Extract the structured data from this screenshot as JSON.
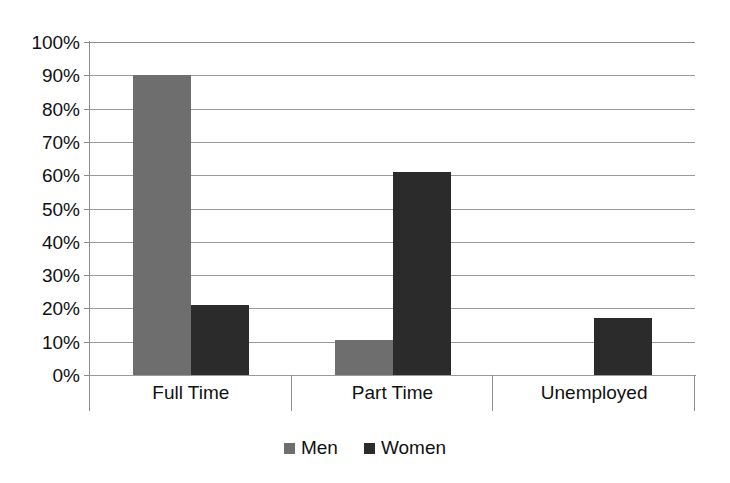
{
  "chart_data": {
    "type": "bar",
    "title": "",
    "subtitle": "",
    "xlabel": "",
    "ylabel": "",
    "categories": [
      "Full Time",
      "Part Time",
      "Unemployed"
    ],
    "series": [
      {
        "name": "Men",
        "color": "#6e6e6e",
        "values": [
          90,
          10.5,
          0
        ]
      },
      {
        "name": "Women",
        "color": "#2b2b2b",
        "values": [
          21,
          61,
          17
        ]
      }
    ],
    "ylim": [
      0,
      100
    ],
    "ytick_values": [
      0,
      10,
      20,
      30,
      40,
      50,
      60,
      70,
      80,
      90,
      100
    ],
    "ytick_labels": [
      "0%",
      "10%",
      "20%",
      "30%",
      "40%",
      "50%",
      "60%",
      "70%",
      "80%",
      "90%",
      "100%"
    ],
    "grid": true,
    "grid_axis": "y",
    "legend_position": "bottom",
    "bar_gap_within_group": 0,
    "value_suffix": "%"
  },
  "legend": {
    "entries": [
      {
        "label": "Men",
        "swatch": "men-swatch"
      },
      {
        "label": "Women",
        "swatch": "women-swatch"
      }
    ]
  },
  "colors": {
    "men": "#6e6e6e",
    "women": "#2b2b2b",
    "gridline": "#9a9a9a",
    "axis": "#8d8d8d",
    "text": "#111111",
    "background": "#ffffff"
  }
}
